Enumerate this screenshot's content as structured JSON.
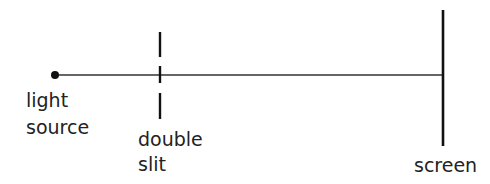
{
  "diagram": {
    "title": "",
    "labels": {
      "source_line1": "light",
      "source_line2": "source",
      "slit_line1": "double",
      "slit_line2": "slit",
      "screen": "screen"
    },
    "colors": {
      "stroke": "#222222",
      "background": "#ffffff"
    }
  }
}
